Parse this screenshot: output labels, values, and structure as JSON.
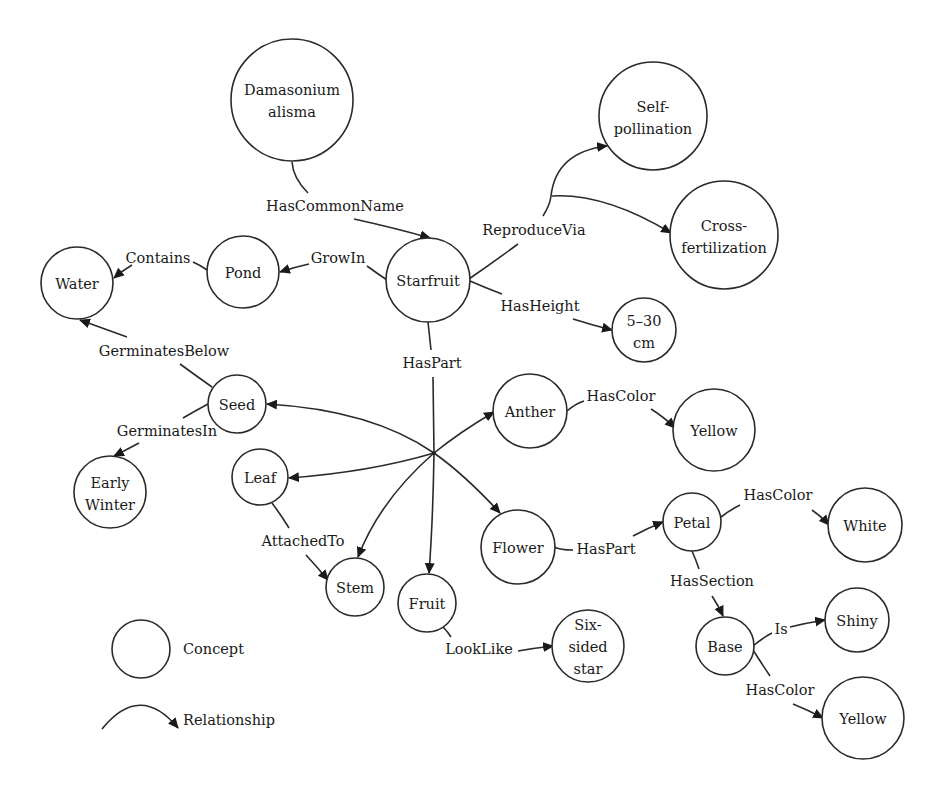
{
  "diagram": {
    "colors": {
      "stroke": "#2a2a2a",
      "text": "#1a1a1a",
      "background": "#ffffff"
    },
    "nodes": {
      "damasonium": {
        "lines": [
          "Damasonium",
          "alisma"
        ]
      },
      "self_pollination": {
        "lines": [
          "Self-",
          "pollination"
        ]
      },
      "cross_fertilization": {
        "lines": [
          "Cross-",
          "fertilization"
        ]
      },
      "water": {
        "lines": [
          "Water"
        ]
      },
      "pond": {
        "lines": [
          "Pond"
        ]
      },
      "starfruit": {
        "lines": [
          "Starfruit"
        ]
      },
      "height": {
        "lines": [
          "5–30",
          "cm"
        ]
      },
      "seed": {
        "lines": [
          "Seed"
        ]
      },
      "early_winter": {
        "lines": [
          "Early",
          "Winter"
        ]
      },
      "anther": {
        "lines": [
          "Anther"
        ]
      },
      "yellow_anther": {
        "lines": [
          "Yellow"
        ]
      },
      "leaf": {
        "lines": [
          "Leaf"
        ]
      },
      "stem": {
        "lines": [
          "Stem"
        ]
      },
      "fruit": {
        "lines": [
          "Fruit"
        ]
      },
      "flower": {
        "lines": [
          "Flower"
        ]
      },
      "petal": {
        "lines": [
          "Petal"
        ]
      },
      "white": {
        "lines": [
          "White"
        ]
      },
      "base": {
        "lines": [
          "Base"
        ]
      },
      "shiny": {
        "lines": [
          "Shiny"
        ]
      },
      "yellow_base": {
        "lines": [
          "Yellow"
        ]
      },
      "six_sided_star": {
        "lines": [
          "Six-",
          "sided",
          "star"
        ]
      }
    },
    "edges": {
      "has_common_name": {
        "label": "HasCommonName",
        "from": "Damasonium alisma",
        "to": "Starfruit"
      },
      "reproduce_via": {
        "label": "ReproduceVia",
        "from": "Starfruit",
        "to": [
          "Self-pollination",
          "Cross-fertilization"
        ]
      },
      "grow_in": {
        "label": "GrowIn",
        "from": "Starfruit",
        "to": "Pond"
      },
      "contains": {
        "label": "Contains",
        "from": "Pond",
        "to": "Water"
      },
      "has_height": {
        "label": "HasHeight",
        "from": "Starfruit",
        "to": "5–30 cm"
      },
      "germinates_below": {
        "label": "GerminatesBelow",
        "from": "Seed",
        "to": "Water"
      },
      "germinates_in": {
        "label": "GerminatesIn",
        "from": "Seed",
        "to": "Early Winter"
      },
      "has_part": {
        "label": "HasPart",
        "from": "Starfruit",
        "to": [
          "Seed",
          "Anther",
          "Leaf",
          "Stem",
          "Fruit",
          "Flower"
        ]
      },
      "anther_has_color": {
        "label": "HasColor",
        "from": "Anther",
        "to": "Yellow"
      },
      "attached_to": {
        "label": "AttachedTo",
        "from": "Leaf",
        "to": "Stem"
      },
      "flower_has_part": {
        "label": "HasPart",
        "from": "Flower",
        "to": "Petal"
      },
      "petal_has_color": {
        "label": "HasColor",
        "from": "Petal",
        "to": "White"
      },
      "has_section": {
        "label": "HasSection",
        "from": "Petal",
        "to": "Base"
      },
      "is": {
        "label": "Is",
        "from": "Base",
        "to": "Shiny"
      },
      "base_has_color": {
        "label": "HasColor",
        "from": "Base",
        "to": "Yellow"
      },
      "look_like": {
        "label": "LookLike",
        "from": "Fruit",
        "to": "Six-sided star"
      }
    },
    "legend": {
      "concept": "Concept",
      "relationship": "Relationship"
    }
  }
}
